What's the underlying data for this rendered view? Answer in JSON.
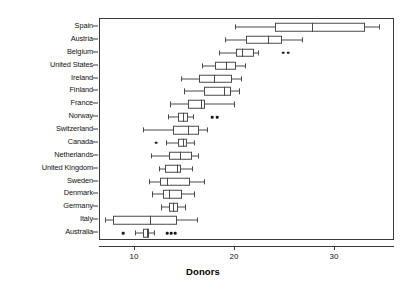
{
  "chart_data": {
    "type": "box",
    "title": "",
    "xlabel": "Donors",
    "ylabel": "",
    "xlim": [
      6.5,
      36
    ],
    "xticks": [
      10,
      20,
      30
    ],
    "xticklabels": [
      "10",
      "20",
      "30"
    ],
    "grid": false,
    "legend": null,
    "orientation": "horizontal",
    "categories": [
      "Spain",
      "Austria",
      "Belgium",
      "United States",
      "Ireland",
      "Finland",
      "France",
      "Norway",
      "Switzerland",
      "Canada",
      "Netherlands",
      "United Kingdom",
      "Sweden",
      "Denmark",
      "Germany",
      "Italy",
      "Australia"
    ],
    "boxes": [
      {
        "category": "Spain",
        "whisker_low": 20.0,
        "q1": 24.0,
        "median": 27.7,
        "q3": 33.0,
        "whisker_high": 34.4,
        "outliers": []
      },
      {
        "category": "Austria",
        "whisker_low": 19.0,
        "q1": 21.1,
        "median": 23.3,
        "q3": 24.7,
        "whisker_high": 26.7,
        "outliers": []
      },
      {
        "category": "Belgium",
        "whisker_low": 18.4,
        "q1": 20.1,
        "median": 20.7,
        "q3": 21.9,
        "whisker_high": 22.3,
        "outliers": [
          24.8,
          25.3
        ]
      },
      {
        "category": "United States",
        "whisker_low": 16.7,
        "q1": 18.0,
        "median": 19.1,
        "q3": 20.1,
        "whisker_high": 21.0,
        "outliers": []
      },
      {
        "category": "Ireland",
        "whisker_low": 14.6,
        "q1": 16.4,
        "median": 17.9,
        "q3": 19.7,
        "whisker_high": 20.6,
        "outliers": []
      },
      {
        "category": "Finland",
        "whisker_low": 14.9,
        "q1": 16.9,
        "median": 18.9,
        "q3": 19.6,
        "whisker_high": 20.4,
        "outliers": []
      },
      {
        "category": "France",
        "whisker_low": 13.5,
        "q1": 15.3,
        "median": 16.6,
        "q3": 17.0,
        "whisker_high": 19.9,
        "outliers": []
      },
      {
        "category": "Norway",
        "whisker_low": 13.3,
        "q1": 14.3,
        "median": 14.8,
        "q3": 15.3,
        "whisker_high": 15.8,
        "outliers": [
          17.7,
          18.2
        ]
      },
      {
        "category": "Switzerland",
        "whisker_low": 10.8,
        "q1": 13.8,
        "median": 15.3,
        "q3": 16.4,
        "whisker_high": 17.2,
        "outliers": []
      },
      {
        "category": "Canada",
        "whisker_low": 13.1,
        "q1": 14.3,
        "median": 14.8,
        "q3": 15.2,
        "whisker_high": 15.9,
        "outliers": [
          12.1
        ]
      },
      {
        "category": "Netherlands",
        "whisker_low": 11.6,
        "q1": 13.4,
        "median": 14.5,
        "q3": 15.7,
        "whisker_high": 16.3,
        "outliers": []
      },
      {
        "category": "United Kingdom",
        "whisker_low": 12.4,
        "q1": 13.0,
        "median": 14.2,
        "q3": 14.6,
        "whisker_high": 15.7,
        "outliers": []
      },
      {
        "category": "Sweden",
        "whisker_low": 11.4,
        "q1": 12.5,
        "median": 13.2,
        "q3": 15.5,
        "whisker_high": 16.9,
        "outliers": []
      },
      {
        "category": "Denmark",
        "whisker_low": 11.7,
        "q1": 12.8,
        "median": 13.4,
        "q3": 14.7,
        "whisker_high": 15.9,
        "outliers": []
      },
      {
        "category": "Germany",
        "whisker_low": 12.6,
        "q1": 13.4,
        "median": 13.8,
        "q3": 14.3,
        "whisker_high": 15.0,
        "outliers": []
      },
      {
        "category": "Italy",
        "whisker_low": 7.0,
        "q1": 7.8,
        "median": 11.5,
        "q3": 14.2,
        "whisker_high": 16.2,
        "outliers": []
      },
      {
        "category": "Australia",
        "whisker_low": 10.0,
        "q1": 10.8,
        "median": 11.2,
        "q3": 11.4,
        "whisker_high": 11.9,
        "outliers": [
          8.8,
          13.2,
          13.6,
          14.0
        ]
      }
    ]
  },
  "colors": {
    "axis": "#3a3a3a",
    "box_stroke": "#4a4a4a",
    "box_fill": "#ffffff",
    "outlier": "#1a1a1a",
    "background": "#ffffff"
  }
}
